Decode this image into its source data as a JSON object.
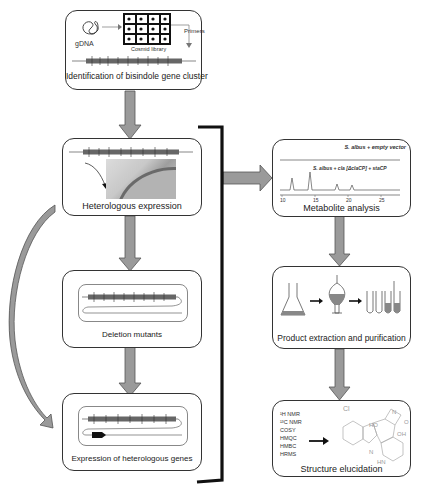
{
  "colors": {
    "arrow_fill": "#9a9a9a",
    "arrow_stroke": "#555555",
    "box_border": "#333333",
    "bracket": "#111111",
    "peak_line": "#555555"
  },
  "steps": {
    "identification": {
      "label": "Identification of bisindole gene cluster",
      "gdna_label": "gDNA",
      "library_label": "Cosmid library",
      "primers_label": "Primers"
    },
    "heterologous_expression": {
      "label": "Heterologous expression"
    },
    "deletion_mutants": {
      "label": "Deletion mutants"
    },
    "expression_heterologous_genes": {
      "label": "Expression of heterologous genes"
    },
    "metabolite_analysis": {
      "label": "Metabolite analysis",
      "trace_top_label": "S. albus + empty vector",
      "trace_bottom_label": "S. albus + cla [ΔclaCP] + staCP",
      "x_ticks": [
        "10",
        "15",
        "20",
        "25"
      ]
    },
    "product_extraction": {
      "label": "Product extraction and purification"
    },
    "structure_elucidation": {
      "label": "Structure elucidation",
      "methods": [
        "¹H NMR",
        "¹³C NMR",
        "COSY",
        "HMQC",
        "HMBC",
        "HRMS"
      ],
      "structure_atoms": [
        "Cl",
        "HO",
        "N",
        "H",
        "O",
        "OH",
        "N",
        "H",
        "HN"
      ]
    }
  }
}
